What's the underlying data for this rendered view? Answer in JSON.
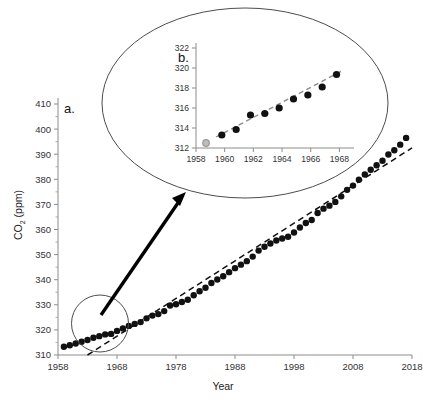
{
  "figure": {
    "background": "#ffffff",
    "ink": "#1a1a1a"
  },
  "chart_data": [
    {
      "id": "panel-a",
      "type": "scatter",
      "panel_label": "a.",
      "title": "",
      "xlabel": "Year",
      "ylabel": "CO2 (ppm)",
      "ylabel_main": "CO",
      "ylabel_sub": "2",
      "ylabel_unit": " (ppm)",
      "xlim": [
        1958,
        2018
      ],
      "ylim": [
        310,
        410
      ],
      "xticks": [
        1958,
        1968,
        1978,
        1988,
        1998,
        2008,
        2018
      ],
      "xtick_labels": [
        "1958",
        "1968",
        "1978",
        "1988",
        "1998",
        "2008",
        "2018"
      ],
      "yticks": [
        310,
        320,
        330,
        340,
        350,
        360,
        370,
        380,
        390,
        400,
        410
      ],
      "ytick_labels": [
        "310",
        "320",
        "330",
        "340",
        "350",
        "360",
        "370",
        "380",
        "390",
        "400",
        "410"
      ],
      "y_minor_step": 5,
      "grid": false,
      "legend": false,
      "marker": "filled-circle",
      "marker_color": "#111111",
      "marker_size_px": 4.2,
      "x": [
        1959,
        1960,
        1961,
        1962,
        1963,
        1964,
        1965,
        1966,
        1967,
        1968,
        1969,
        1970,
        1971,
        1972,
        1973,
        1974,
        1975,
        1976,
        1977,
        1978,
        1979,
        1980,
        1981,
        1982,
        1983,
        1984,
        1985,
        1986,
        1987,
        1988,
        1989,
        1990,
        1991,
        1992,
        1993,
        1994,
        1995,
        1996,
        1997,
        1998,
        1999,
        2000,
        2001,
        2002,
        2003,
        2004,
        2005,
        2006,
        2007,
        2008,
        2009,
        2010,
        2011,
        2012,
        2013,
        2014,
        2015,
        2016,
        2017
      ],
      "y": [
        313.3,
        313.9,
        314.6,
        315.3,
        316.0,
        316.9,
        317.5,
        318.2,
        318.4,
        319.6,
        320.6,
        321.6,
        322.4,
        323.1,
        324.6,
        325.7,
        326.3,
        327.5,
        329.7,
        330.2,
        331.1,
        332.0,
        333.8,
        335.4,
        336.8,
        338.7,
        340.1,
        341.4,
        343.0,
        344.6,
        346.0,
        347.4,
        349.2,
        351.6,
        353.1,
        354.4,
        355.6,
        356.4,
        357.1,
        358.8,
        360.8,
        362.6,
        363.8,
        366.6,
        368.3,
        369.5,
        371.0,
        373.2,
        375.8,
        377.5,
        379.8,
        381.9,
        383.8,
        385.6,
        387.4,
        389.9,
        391.6,
        393.8,
        396.5
      ],
      "annotations": {
        "trend": {
          "type": "linear-trend",
          "style": "dashed",
          "color": "#111111",
          "x_start": 1963,
          "y_start": 310,
          "x_end": 2018,
          "y_end": 392.5
        },
        "highlight_circle": {
          "type": "circle-callout",
          "center_year": 1963.6,
          "center_ppm": 317.5,
          "label": "early-data-highlight"
        },
        "arrow": {
          "type": "callout-arrow",
          "from": "highlight-circle",
          "to": "inset-ellipse"
        }
      }
    },
    {
      "id": "panel-b",
      "type": "scatter",
      "panel_label": "b.",
      "title": "",
      "xlabel": "",
      "ylabel": "",
      "xlim": [
        1958,
        1968.6
      ],
      "ylim": [
        312,
        322
      ],
      "xticks": [
        1958,
        1960,
        1962,
        1964,
        1966,
        1968
      ],
      "xtick_labels": [
        "1958",
        "1960",
        "1962",
        "1964",
        "1966",
        "1968"
      ],
      "yticks": [
        312,
        314,
        316,
        318,
        320,
        322
      ],
      "ytick_labels": [
        "312",
        "314",
        "316",
        "318",
        "320",
        "322"
      ],
      "grid": false,
      "legend": false,
      "marker": "filled-circle",
      "marker_color": "#111111",
      "marker_size_px": 4.6,
      "first_point_style": "open-gray-circle",
      "first_point_color": "#999999",
      "x": [
        1958.7,
        1959.8,
        1960.8,
        1961.8,
        1962.8,
        1963.8,
        1964.8,
        1965.8,
        1966.8,
        1967.8
      ],
      "y": [
        312.5,
        313.3,
        313.85,
        315.3,
        315.45,
        316.0,
        316.9,
        317.3,
        318.1,
        319.35
      ],
      "annotations": {
        "trend": {
          "type": "linear-trend",
          "style": "dashed",
          "color": "#8c8c8c",
          "x_start": 1959.4,
          "y_start": 313.1,
          "x_end": 1968.3,
          "y_end": 319.8
        },
        "ellipse_frame": {
          "type": "ellipse-outline",
          "color": "#4d4d4d"
        }
      }
    }
  ]
}
